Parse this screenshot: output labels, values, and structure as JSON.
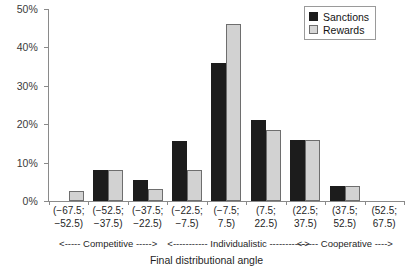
{
  "chart_data": {
    "type": "bar",
    "title": "",
    "xlabel": "Final distributional angle",
    "ylabel": "",
    "ylim": [
      0,
      50
    ],
    "yticks": [
      0,
      10,
      20,
      30,
      40,
      50
    ],
    "ytick_labels": [
      "0%",
      "10%",
      "20%",
      "30%",
      "40%",
      "50%"
    ],
    "grid": false,
    "legend_position": "top-right",
    "categories": [
      "(−67.5; −52.5)",
      "(−52.5; −37.5)",
      "(−37.5; −22.5)",
      "(−22.5; −7.5)",
      "(−7.5; 7.5)",
      "(7.5; 22.5)",
      "(22.5; 37.5)",
      "(37.5; 52.5)",
      "(52.5; 67.5)"
    ],
    "category_lines": [
      [
        "(−67.5;",
        "−52.5)"
      ],
      [
        "(−52.5;",
        "−37.5)"
      ],
      [
        "(−37.5;",
        "−22.5)"
      ],
      [
        "(−22.5;",
        "−7.5)"
      ],
      [
        "(−7.5;",
        "7.5)"
      ],
      [
        "(7.5;",
        "22.5)"
      ],
      [
        "(22.5;",
        "37.5)"
      ],
      [
        "(37.5;",
        "52.5)"
      ],
      [
        "(52.5;",
        "67.5)"
      ]
    ],
    "series": [
      {
        "name": "Sanctions",
        "color": "#1c1c1c",
        "values": [
          0,
          8,
          5.5,
          15.5,
          36,
          21,
          16,
          4,
          0
        ]
      },
      {
        "name": "Rewards",
        "color": "#d2d2d2",
        "values": [
          2.5,
          8,
          3,
          8,
          46,
          18.5,
          16,
          4,
          0
        ]
      }
    ],
    "annotations": [
      {
        "text": "<----- Competitive ----->",
        "span": "categories 1-3"
      },
      {
        "text": "<----------- Individualistic ----------->",
        "span": "categories 4-6"
      },
      {
        "text": "<----- Cooperative ---->",
        "span": "categories 7-9"
      }
    ]
  },
  "legend": {
    "items": [
      {
        "label": "Sanctions",
        "swatch": "sanctions-swatch"
      },
      {
        "label": "Rewards",
        "swatch": "rewards-swatch"
      }
    ]
  }
}
